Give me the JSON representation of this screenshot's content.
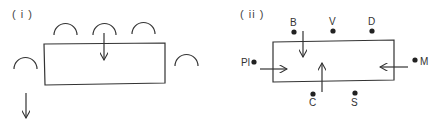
{
  "panels": [
    {
      "label": "( i )",
      "description": "Rectangle surrounded by arc symbols, with a downward arrow into the box and a separate downward arrow below-left",
      "arcs": 5,
      "arrows": [
        "down-into-box",
        "down-outside"
      ]
    },
    {
      "label": "( ii )",
      "description": "Rectangle surrounded by labeled dots with arrows pointing into the box",
      "points": [
        {
          "id": "B",
          "label": "B"
        },
        {
          "id": "V",
          "label": "V"
        },
        {
          "id": "D",
          "label": "D"
        },
        {
          "id": "Pl",
          "label": "Pl"
        },
        {
          "id": "M",
          "label": "M"
        },
        {
          "id": "C",
          "label": "C"
        },
        {
          "id": "S",
          "label": "S"
        }
      ],
      "arrows": [
        "from-B-down",
        "from-Pl-right",
        "from-C-up",
        "from-M-left"
      ]
    }
  ],
  "colors": {
    "ink": "#333333",
    "background": "#ffffff"
  }
}
